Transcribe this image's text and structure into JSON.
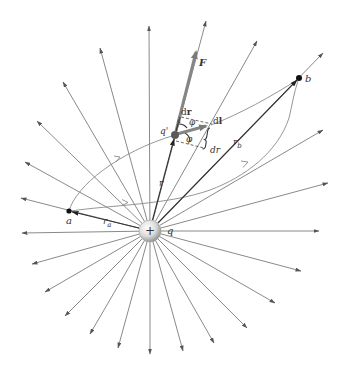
{
  "figure": {
    "charge": {
      "cx": 150,
      "cy": 231,
      "r": 11,
      "sign": "+",
      "label": "q"
    },
    "colors": {
      "field_line": "#7c7c7c",
      "vector": "#858585",
      "dark": "#333333",
      "charge_highlight": "#ffffff",
      "charge_edge": "#8c8c8c"
    },
    "field_line_endpoints": [
      [
        149,
        26
      ],
      [
        206,
        21
      ],
      [
        257,
        41
      ],
      [
        323,
        53
      ],
      [
        323,
        130
      ],
      [
        328,
        183
      ],
      [
        319,
        231
      ],
      [
        301,
        271
      ],
      [
        275,
        303
      ],
      [
        247,
        328
      ],
      [
        214,
        343
      ],
      [
        183,
        351
      ],
      [
        150,
        354
      ],
      [
        118,
        348
      ],
      [
        90,
        334
      ],
      [
        65,
        316
      ],
      [
        45,
        292
      ],
      [
        32,
        264
      ],
      [
        22,
        233
      ],
      [
        21,
        198
      ],
      [
        25,
        162
      ],
      [
        37,
        121
      ],
      [
        63,
        82
      ],
      [
        100,
        48
      ]
    ],
    "points": {
      "a": {
        "x": 69,
        "y": 211,
        "label": "a"
      },
      "b": {
        "x": 299,
        "y": 78,
        "label": "b"
      },
      "test_charge": {
        "x": 175,
        "y": 135,
        "label": "q'"
      }
    },
    "labels": {
      "force": "F",
      "dr_vector_d": "d",
      "dr_vector_r": "r",
      "phi_top": "φ",
      "phi_bottom": "φ",
      "dl_d": "d",
      "dl_l": "l",
      "dr_scalar": "dr",
      "r": "r",
      "rb_main": "r",
      "rb_sub": "b",
      "ra_main": "r",
      "ra_sub": "a"
    }
  }
}
